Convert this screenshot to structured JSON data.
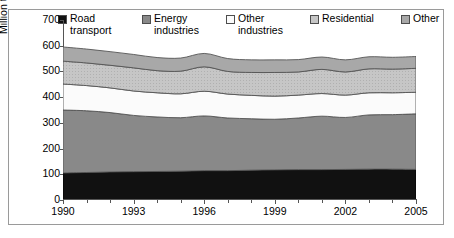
{
  "chart_data": {
    "type": "area",
    "title": "",
    "subtitle": "",
    "xlabel": "",
    "ylabel": "Million tonnes CO2 equivalent",
    "ylabel_parts": {
      "pre": "Million tonnes CO",
      "sub": "2",
      "post": " equivalent"
    },
    "stacked": true,
    "grid": false,
    "legend_position": "top",
    "xlim": [
      1990,
      2005
    ],
    "ylim": [
      0,
      700
    ],
    "ytick_values": [
      0,
      100,
      200,
      300,
      400,
      500,
      600,
      700
    ],
    "ytick_labels": [
      "0",
      "100",
      "200",
      "300",
      "400",
      "500",
      "600",
      "700"
    ],
    "xtick_values": [
      1990,
      1993,
      1996,
      1999,
      2002,
      2005
    ],
    "xtick_labels": [
      "1990",
      "1993",
      "1996",
      "1999",
      "2002",
      "2005"
    ],
    "x": [
      1990,
      1991,
      1992,
      1993,
      1994,
      1995,
      1996,
      1997,
      1998,
      1999,
      2000,
      2001,
      2002,
      2003,
      2004,
      2005
    ],
    "series": [
      {
        "name": "Road transport",
        "legend_label": "Road\ntransport",
        "color": "#111111",
        "edge_color": "#000000",
        "values": [
          105,
          107,
          109,
          110,
          111,
          112,
          114,
          114,
          116,
          117,
          118,
          118,
          119,
          120,
          120,
          119
        ]
      },
      {
        "name": "Energy industries",
        "legend_label": "Energy\nindustries",
        "color": "#898989",
        "edge_color": "#555555",
        "values": [
          245,
          240,
          231,
          219,
          212,
          208,
          213,
          205,
          200,
          197,
          201,
          208,
          202,
          211,
          212,
          216
        ]
      },
      {
        "name": "Other industries",
        "legend_label": "Other\nindustries",
        "color": "#fbfbfb",
        "edge_color": "#555555",
        "values": [
          101,
          98,
          96,
          95,
          94,
          93,
          96,
          93,
          91,
          90,
          89,
          88,
          87,
          86,
          85,
          84
        ]
      },
      {
        "name": "Residential",
        "legend_label": "Residential",
        "color": "#c6c6c6",
        "edge_color": "#555555",
        "values": [
          89,
          88,
          88,
          90,
          86,
          88,
          95,
          88,
          89,
          92,
          90,
          94,
          90,
          93,
          92,
          93
        ]
      },
      {
        "name": "Other",
        "legend_label": "Other",
        "color": "#a8a8a8",
        "edge_color": "#555555",
        "values": [
          55,
          54,
          53,
          52,
          51,
          51,
          52,
          50,
          49,
          49,
          48,
          48,
          47,
          47,
          46,
          46
        ]
      }
    ],
    "totals": [
      595,
      587,
      577,
      566,
      554,
      552,
      570,
      550,
      545,
      545,
      546,
      556,
      545,
      557,
      555,
      558
    ]
  },
  "legend": {
    "items": [
      {
        "label": "Road\ntransport",
        "color": "#111111",
        "left": 0
      },
      {
        "label": "Energy\nindustries",
        "color": "#898989",
        "left": 84
      },
      {
        "label": "Other\nindustries",
        "color": "#fbfbfb",
        "left": 168
      },
      {
        "label": "Residential",
        "color": "#c6c6c6",
        "left": 252
      },
      {
        "label": "Other",
        "color": "#a8a8a8",
        "left": 343
      }
    ]
  },
  "colors": {
    "frame": "#9a9a9a",
    "axis": "#555555",
    "background": "#ffffff",
    "text": "#000000"
  }
}
